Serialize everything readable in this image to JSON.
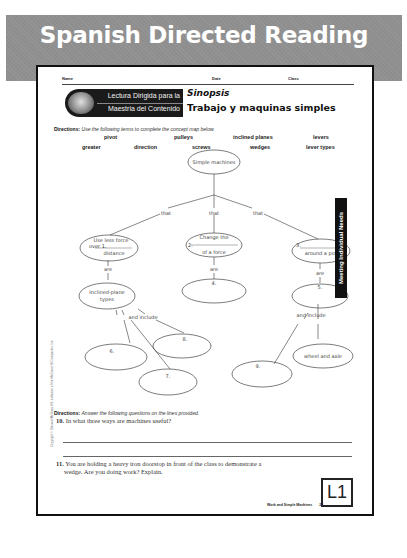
{
  "banner": {
    "title": "Spanish Directed Reading"
  },
  "header_fields": {
    "name_label": "Name",
    "date_label": "Date",
    "class_label": "Class"
  },
  "series_banner": {
    "line1": "Lectura Dirigida para la",
    "line2": "Maestria del Contenido"
  },
  "section": {
    "label": "Sinopsis",
    "title": "Trabajo y maquinas simples"
  },
  "directions1": {
    "label": "Directions:",
    "text": "Use the following terms to complete the concept map below."
  },
  "terms": {
    "row1": [
      "pivot",
      "pulleys",
      "inclined planes",
      "levers"
    ],
    "row2": [
      "greater",
      "direction",
      "screws",
      "wedges",
      "lever types"
    ]
  },
  "concept_map": {
    "root": "Simple machines",
    "connectors": {
      "that": "that",
      "are": "are",
      "and_include": "and include"
    },
    "node1": {
      "line1": "Use less force",
      "line2": "over 1.",
      "line3": "distance"
    },
    "node2": {
      "line1": "Change the",
      "line2": "2.",
      "line3": "of a force"
    },
    "node3": {
      "line1": "3.",
      "line2": "around a point"
    },
    "node_inclined": {
      "line1": "Inclined-plane",
      "line2": "types"
    },
    "node4": "4.",
    "node5": "5.",
    "node6": "6.",
    "node7": "7.",
    "node8": "8.",
    "node9": "9.",
    "node_wheel": "wheel and axle"
  },
  "side_tab": {
    "label": "Meeting Individual Needs"
  },
  "copyright": "Copyright © Glencoe/McGraw-Hill, a division of the McGraw-Hill Companies, Inc.",
  "directions2": {
    "label": "Directions:",
    "text": "Answer the following questions on the lines provided."
  },
  "questions": [
    {
      "number": "10.",
      "text": "In what three ways are machines useful?"
    },
    {
      "number": "11.",
      "text": "You are holding a heavy iron doorstop in front of the class to demonstrate a",
      "text2": "wedge. Are you doing work? Explain."
    }
  ],
  "level_badge": "L1",
  "footer": {
    "text": "Work and Simple Machines",
    "page": "23"
  }
}
